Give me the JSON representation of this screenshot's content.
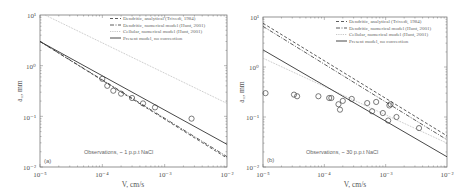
{
  "chart_data": [
    {
      "type": "line",
      "panel": "(a)",
      "xlabel": "V, cm/s",
      "ylabel": "a_1, mm",
      "xscale": "log",
      "yscale": "log",
      "xlim": [
        1e-05,
        0.01
      ],
      "ylim": [
        0.01,
        10
      ],
      "x_ticks": [
        "10^-5",
        "10^-4",
        "10^-3",
        "10^-2"
      ],
      "y_ticks": [
        "10^1",
        "10^0",
        "10^-1",
        "10^-2"
      ],
      "grid": false,
      "legend_position": "upper right",
      "annotation": "Observations, ~ 1 p.p.t NaCl",
      "series": [
        {
          "name": "Dendritic, analytical (Trivedi, 1984)",
          "style": "dashed",
          "x": [
            1e-05,
            0.01
          ],
          "y": [
            3.0,
            0.015
          ]
        },
        {
          "name": "Dendritic, numerical model (Hunt, 2001)",
          "style": "dashdot",
          "x": [
            1e-05,
            0.01
          ],
          "y": [
            3.0,
            0.016
          ]
        },
        {
          "name": "Cellular, numerical model (Hunt, 2001)",
          "style": "dotted",
          "x": [
            1.2e-05,
            0.01
          ],
          "y": [
            10.0,
            0.18
          ]
        },
        {
          "name": "Present model, no convection",
          "style": "solid",
          "x": [
            1e-05,
            0.01
          ],
          "y": [
            3.0,
            0.028
          ]
        },
        {
          "name": "Observations",
          "style": "marker-circle",
          "x": [
            0.0001,
            0.00012,
            0.00015,
            0.0002,
            0.0003,
            0.00045,
            0.0007,
            0.0027
          ],
          "y": [
            0.55,
            0.4,
            0.32,
            0.28,
            0.23,
            0.18,
            0.15,
            0.09
          ]
        }
      ]
    },
    {
      "type": "line",
      "panel": "(b)",
      "xlabel": "V, cm/s",
      "ylabel": "a_1, mm",
      "xscale": "log",
      "yscale": "log",
      "xlim": [
        1e-05,
        0.01
      ],
      "ylim": [
        0.01,
        10
      ],
      "x_ticks": [
        "10^-5",
        "10^-4",
        "10^-3",
        "10^-2"
      ],
      "y_ticks": [
        "10^1",
        "10^0",
        "10^-1",
        "10^-2"
      ],
      "grid": false,
      "legend_position": "upper right",
      "annotation": "Observations, ~ 30 p.p.t NaCl",
      "series": [
        {
          "name": "Dendritic, analytical (Trivedi, 1984)",
          "style": "dashed",
          "x": [
            1e-05,
            0.01
          ],
          "y": [
            7.5,
            0.042
          ]
        },
        {
          "name": "Dendritic, numerical model (Hunt, 2001)",
          "style": "dashdot",
          "x": [
            1e-05,
            0.01
          ],
          "y": [
            6.5,
            0.035
          ]
        },
        {
          "name": "Cellular, numerical model (Hunt, 2001)",
          "style": "dotted",
          "x": [
            1e-05,
            0.01
          ],
          "y": [
            1.5,
            0.03
          ]
        },
        {
          "name": "Present model, no convection",
          "style": "solid",
          "x": [
            1e-05,
            0.01
          ],
          "y": [
            2.2,
            0.016
          ]
        },
        {
          "name": "Observations",
          "style": "marker-circle",
          "x": [
            1.1e-05,
            3.2e-05,
            3.6e-05,
            8e-05,
            0.00012,
            0.00013,
            0.00017,
            0.00018,
            0.0002,
            0.00028,
            0.0005,
            0.0006,
            0.0007,
            0.0009,
            0.0011,
            0.00115,
            0.0012,
            0.0015,
            0.0035
          ],
          "y": [
            0.3,
            0.28,
            0.26,
            0.26,
            0.24,
            0.24,
            0.18,
            0.14,
            0.21,
            0.23,
            0.19,
            0.13,
            0.2,
            0.12,
            0.085,
            0.17,
            0.18,
            0.1,
            0.06
          ]
        }
      ]
    }
  ],
  "panels": [
    {
      "tag": "(a)",
      "annotation": "Observations, ~ 1 p.p.t NaCl",
      "xlabel": "V, cm/s",
      "ylabel": "a₁, mm",
      "legend": [
        "Dendritic, analytical (Trivedi, 1984)",
        "Dendritic, numerical model (Hunt, 2001)",
        "Cellular, numerical model (Hunt, 2001)",
        "Present model, no convection"
      ],
      "xticks": [
        "10⁻⁵",
        "10⁻⁴",
        "10⁻³",
        "10⁻²"
      ],
      "yticks": [
        "10¹",
        "10⁰",
        "10⁻¹",
        "10⁻²"
      ]
    },
    {
      "tag": "(b)",
      "annotation": "Observations, ~ 30 p.p.t NaCl",
      "xlabel": "V, cm/s",
      "ylabel": "a₁, mm",
      "legend": [
        "Dendritic, analytical (Trivedi, 1984)",
        "Dendritic, numerical model (Hunt, 2001)",
        "Cellular, numerical model (Hunt, 2001)",
        "Present model, no convection"
      ],
      "xticks": [
        "10⁻⁵",
        "10⁻⁴",
        "10⁻³",
        "10⁻²"
      ],
      "yticks": [
        "10¹",
        "10⁰",
        "10⁻¹",
        "10⁻²"
      ]
    }
  ],
  "colors": {
    "frame": "#555555",
    "model_lines": "#333333",
    "cellular_line": "#bbbbbb",
    "markers": "#444444",
    "text": "#555555"
  }
}
